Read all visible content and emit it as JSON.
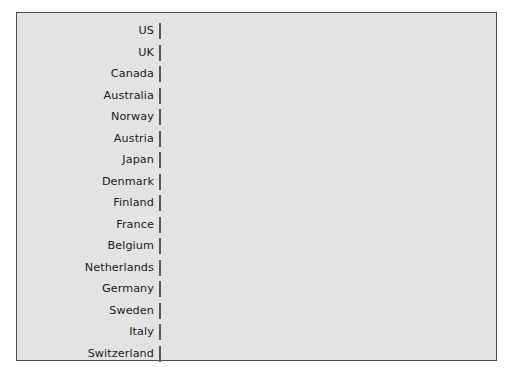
{
  "chart_data": {
    "type": "bar",
    "orientation": "horizontal",
    "title": "",
    "subtitle": "",
    "xlabel": "",
    "ylabel": "",
    "grid": false,
    "legend": false,
    "legend_position": "none",
    "axis_ticks_visible": false,
    "xlim": [
      0,
      262
    ],
    "categories": [
      "US",
      "UK",
      "Canada",
      "Australia",
      "Norway",
      "Austria",
      "Japan",
      "Denmark",
      "Finland",
      "France",
      "Belgium",
      "Netherlands",
      "Germany",
      "Sweden",
      "Italy",
      "Switzerland"
    ],
    "values": [
      262,
      259,
      189,
      152,
      132,
      120,
      94,
      95,
      91,
      88,
      86,
      66,
      65,
      59,
      55,
      53
    ],
    "bar_color": "#8b8b8b",
    "bar_edge_color": "#575757",
    "panel_background": "#e3e3e3",
    "panel_border_color": "#4c4c4c",
    "figure_background": "#ffffff",
    "label_color": "#1b1b1b"
  }
}
